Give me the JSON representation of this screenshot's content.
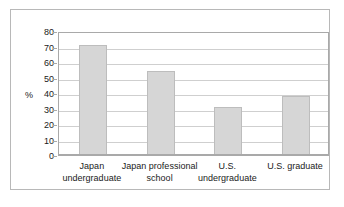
{
  "chart_data": {
    "type": "bar",
    "title": "",
    "xlabel": "",
    "ylabel": "%",
    "categories": [
      "Japan undergraduate",
      "Japan professional school",
      "U.S. undergraduate",
      "U.S. graduate"
    ],
    "category_lines": [
      [
        "Japan",
        "undergraduate"
      ],
      [
        "Japan professional",
        "school"
      ],
      [
        "U.S.",
        "undergraduate"
      ],
      [
        "U.S. graduate"
      ]
    ],
    "values": [
      71,
      54,
      31,
      38
    ],
    "ylim": [
      0,
      80
    ],
    "ytick_step": 10,
    "yticks": [
      "80",
      "70",
      "60",
      "50",
      "40",
      "30",
      "20",
      "10",
      "0"
    ],
    "ytick_values": [
      80,
      70,
      60,
      50,
      40,
      30,
      20,
      10,
      0
    ],
    "grid": true,
    "legend": "none",
    "colors": {
      "bar_fill": "#d6d6d6",
      "bar_border": "#bdbdbd",
      "gridline": "#cfcfcf",
      "axis": "#a9a9a9",
      "frame": "#b8b8b8",
      "text": "#1a1a1a",
      "background": "#ffffff"
    }
  }
}
